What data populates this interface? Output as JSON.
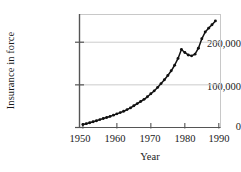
{
  "chart_data": {
    "type": "line",
    "title": "",
    "xlabel": "Year",
    "ylabel": "Insurance in force",
    "xlim": [
      1949,
      1990.5
    ],
    "ylim": [
      0,
      265000
    ],
    "xticks": [
      1950,
      1960,
      1970,
      1980,
      1990
    ],
    "xtick_labels": [
      "1950",
      "1960",
      "1970",
      "1980",
      "1990"
    ],
    "yticks": [
      0,
      100000,
      200000
    ],
    "ytick_labels": [
      "0",
      "100,000",
      "200,000"
    ],
    "grid": "horizontal",
    "legend": null,
    "marker": "filled-circle",
    "line_color": "#111111",
    "marker_color": "#111111",
    "grid_color": "#cccccc",
    "frame_color": "#c8c8c8",
    "axis_color": "#555555",
    "x": [
      1950,
      1951,
      1952,
      1953,
      1954,
      1955,
      1956,
      1957,
      1958,
      1959,
      1960,
      1961,
      1962,
      1963,
      1964,
      1965,
      1966,
      1967,
      1968,
      1969,
      1970,
      1971,
      1972,
      1973,
      1974,
      1975,
      1976,
      1977,
      1978,
      1979,
      1980,
      1981,
      1982,
      1983,
      1984,
      1985,
      1986,
      1987,
      1988,
      1989
    ],
    "values": [
      7000,
      9000,
      11000,
      13500,
      16000,
      18500,
      21000,
      23500,
      26000,
      29000,
      32000,
      35000,
      38000,
      42000,
      46000,
      51000,
      56000,
      61000,
      66000,
      72000,
      79000,
      86000,
      94000,
      103000,
      112000,
      122000,
      133000,
      146000,
      162000,
      183000,
      176000,
      170000,
      168000,
      172000,
      186000,
      208000,
      224000,
      233000,
      241000,
      250000
    ],
    "series": [
      {
        "name": "Insurance in force",
        "values": [
          7000,
          9000,
          11000,
          13500,
          16000,
          18500,
          21000,
          23500,
          26000,
          29000,
          32000,
          35000,
          38000,
          42000,
          46000,
          51000,
          56000,
          61000,
          66000,
          72000,
          79000,
          86000,
          94000,
          103000,
          112000,
          122000,
          133000,
          146000,
          162000,
          183000,
          176000,
          170000,
          168000,
          172000,
          186000,
          208000,
          224000,
          233000,
          241000,
          250000
        ]
      }
    ],
    "annotations": []
  }
}
